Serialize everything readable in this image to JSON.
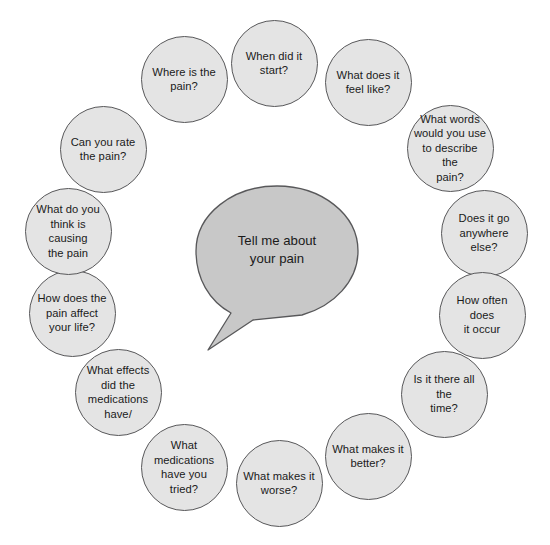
{
  "diagram": {
    "title": "Tell me about your pain",
    "top_artifact_text": "·   ·    ·     ·                ·                        ·",
    "colors": {
      "node_fill": "#e4e4e4",
      "node_stroke": "#58585a",
      "bubble_fill": "#c8c8c8",
      "bubble_stroke": "#58585a",
      "text": "#1a1a1a",
      "background": "#ffffff"
    },
    "center": {
      "name": "central-speech-bubble",
      "line1": "Tell me about",
      "line2": "your pain",
      "x": 193,
      "y": 183,
      "width": 168,
      "height": 172
    },
    "nodes": [
      {
        "id": "where-is-the-pain",
        "lines": [
          "Where is the",
          "pain?"
        ],
        "cx": 184,
        "cy": 79,
        "d": 87
      },
      {
        "id": "when-did-it-start",
        "lines": [
          "When did it",
          "start?"
        ],
        "cx": 274,
        "cy": 63,
        "d": 87
      },
      {
        "id": "what-does-it-feel-like",
        "lines": [
          "What does it",
          "feel like?"
        ],
        "cx": 368,
        "cy": 82,
        "d": 87
      },
      {
        "id": "what-words-describe-pain",
        "lines": [
          "What words",
          "would you use",
          "to describe the",
          "pain?"
        ],
        "cx": 450,
        "cy": 148,
        "d": 87
      },
      {
        "id": "does-it-go-anywhere-else",
        "lines": [
          "Does it go",
          "anywhere else?"
        ],
        "cx": 484,
        "cy": 233,
        "d": 87
      },
      {
        "id": "how-often-does-it-occur",
        "lines": [
          "How often does",
          "it occur"
        ],
        "cx": 482,
        "cy": 315,
        "d": 87
      },
      {
        "id": "is-it-there-all-the-time",
        "lines": [
          "Is it there all the",
          "time?"
        ],
        "cx": 444,
        "cy": 394,
        "d": 87
      },
      {
        "id": "what-makes-it-better",
        "lines": [
          "What makes it",
          "better?"
        ],
        "cx": 368,
        "cy": 456,
        "d": 87
      },
      {
        "id": "what-makes-it-worse",
        "lines": [
          "What makes it",
          "worse?"
        ],
        "cx": 279,
        "cy": 483,
        "d": 87
      },
      {
        "id": "what-medications-have-you-tried",
        "lines": [
          "What",
          "medications",
          "have you tried?"
        ],
        "cx": 184,
        "cy": 467,
        "d": 87
      },
      {
        "id": "what-effects-did-medications-have",
        "lines": [
          "What effects",
          "did the",
          "medications",
          "have/"
        ],
        "cx": 118,
        "cy": 392,
        "d": 87
      },
      {
        "id": "how-does-pain-affect-your-life",
        "lines": [
          "How does the",
          "pain affect",
          "your life?"
        ],
        "cx": 72,
        "cy": 313,
        "d": 87
      },
      {
        "id": "what-do-you-think-is-causing-the-pain",
        "lines": [
          "What do you",
          "think is causing",
          "the pain"
        ],
        "cx": 68,
        "cy": 231,
        "d": 87
      },
      {
        "id": "can-you-rate-the-pain",
        "lines": [
          "Can you rate",
          "the pain?"
        ],
        "cx": 103,
        "cy": 149,
        "d": 87
      }
    ]
  }
}
